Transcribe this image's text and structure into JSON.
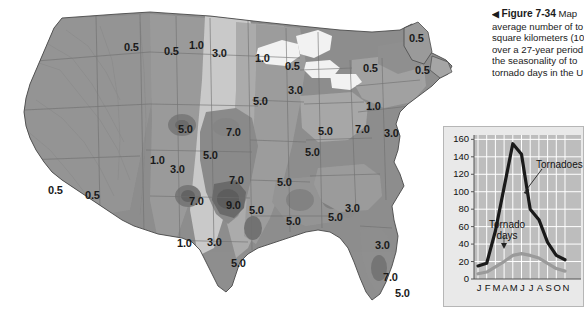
{
  "figure": {
    "caption_arrow": "◀",
    "caption_lines": [
      {
        "bold": "Figure 7-34",
        "rest": " Map"
      },
      {
        "bold": "",
        "rest": "average number of to"
      },
      {
        "bold": "",
        "rest": "square kilometers (10"
      },
      {
        "bold": "",
        "rest": "over a 27-year period"
      },
      {
        "bold": "",
        "rest": "the seasonality of to"
      },
      {
        "bold": "",
        "rest": "tornado days in the U"
      }
    ]
  },
  "map": {
    "name": "united-states-tornado-frequency-contour-map",
    "contour_labels": [
      {
        "value": "0.5",
        "x": 124,
        "y": 42
      },
      {
        "value": "0.5",
        "x": 164,
        "y": 46
      },
      {
        "value": "1.0",
        "x": 189,
        "y": 40
      },
      {
        "value": "1.0",
        "x": 255,
        "y": 53
      },
      {
        "value": "3.0",
        "x": 212,
        "y": 48
      },
      {
        "value": "0.5",
        "x": 285,
        "y": 61
      },
      {
        "value": "0.5",
        "x": 363,
        "y": 63
      },
      {
        "value": "0.5",
        "x": 409,
        "y": 33
      },
      {
        "value": "0.5",
        "x": 415,
        "y": 65
      },
      {
        "value": "3.0",
        "x": 288,
        "y": 85
      },
      {
        "value": "5.0",
        "x": 253,
        "y": 96
      },
      {
        "value": "1.0",
        "x": 366,
        "y": 101
      },
      {
        "value": "5.0",
        "x": 178,
        "y": 124
      },
      {
        "value": "7.0",
        "x": 226,
        "y": 127
      },
      {
        "value": "5.0",
        "x": 318,
        "y": 126
      },
      {
        "value": "7.0",
        "x": 355,
        "y": 124
      },
      {
        "value": "3.0",
        "x": 384,
        "y": 128
      },
      {
        "value": "5.0",
        "x": 203,
        "y": 150
      },
      {
        "value": "5.0",
        "x": 305,
        "y": 147
      },
      {
        "value": "1.0",
        "x": 150,
        "y": 155
      },
      {
        "value": "3.0",
        "x": 170,
        "y": 164
      },
      {
        "value": "0.5",
        "x": 48,
        "y": 185
      },
      {
        "value": "0.5",
        "x": 85,
        "y": 190
      },
      {
        "value": "7.0",
        "x": 229,
        "y": 175
      },
      {
        "value": "5.0",
        "x": 277,
        "y": 177
      },
      {
        "value": "7.0",
        "x": 189,
        "y": 196
      },
      {
        "value": "9.0",
        "x": 226,
        "y": 200
      },
      {
        "value": "5.0",
        "x": 249,
        "y": 205
      },
      {
        "value": "5.0",
        "x": 286,
        "y": 216
      },
      {
        "value": "5.0",
        "x": 328,
        "y": 212
      },
      {
        "value": "1.0",
        "x": 177,
        "y": 238
      },
      {
        "value": "3.0",
        "x": 207,
        "y": 237
      },
      {
        "value": "3.0",
        "x": 345,
        "y": 203
      },
      {
        "value": "3.0",
        "x": 375,
        "y": 240
      },
      {
        "value": "5.0",
        "x": 231,
        "y": 258
      },
      {
        "value": "7.0",
        "x": 383,
        "y": 272
      },
      {
        "value": "5.0",
        "x": 395,
        "y": 288
      }
    ]
  },
  "chart_data": {
    "type": "line",
    "title": "",
    "xlabel": "",
    "ylabel": "",
    "categories": [
      "J",
      "F",
      "M",
      "A",
      "M",
      "J",
      "J",
      "A",
      "S",
      "O",
      "N"
    ],
    "month_labels_full": [
      "January",
      "February",
      "March",
      "April",
      "May",
      "June",
      "July",
      "August",
      "September",
      "October",
      "November"
    ],
    "ylim": [
      0,
      165
    ],
    "yticks": [
      0,
      20,
      40,
      60,
      80,
      100,
      120,
      140,
      160
    ],
    "grid": true,
    "legend": "inline-annotations",
    "series": [
      {
        "name": "Tornadoes",
        "color": "#1a1a1a",
        "values": [
          15,
          18,
          55,
          105,
          155,
          143,
          80,
          68,
          42,
          27,
          22
        ]
      },
      {
        "name": "Tornado days",
        "color": "#9a9a9a",
        "values": [
          6,
          8,
          14,
          20,
          27,
          29,
          27,
          24,
          18,
          12,
          9
        ]
      }
    ],
    "annotations": [
      {
        "text": "Tornadoes",
        "series": "Tornadoes"
      },
      {
        "text": "Tornado\ndays",
        "series": "Tornado days"
      }
    ]
  },
  "chart_ui": {
    "tornadoes_label": "Tornadoes",
    "tornado_days_line1": "Tornado",
    "tornado_days_line2": "days"
  },
  "colors": {
    "map_land_base": "#8f8f8f",
    "map_light": "#d8d8d8",
    "map_mid": "#a8a8a8",
    "map_dark": "#6e6e6e",
    "map_darkest": "#555555",
    "chart_bg": "#e9e9e9",
    "chart_plot": "#bdbdbd",
    "chart_grid": "#ffffff",
    "tornadoes_line": "#1a1a1a",
    "tornado_days_line": "#9a9a9a",
    "text": "#1b1b1b"
  }
}
